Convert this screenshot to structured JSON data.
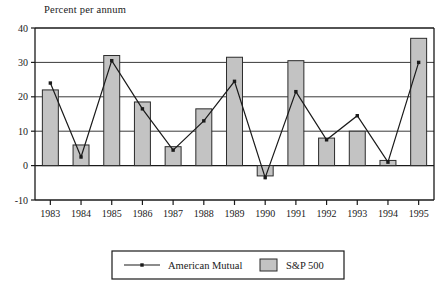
{
  "chart_data": {
    "type": "bar",
    "title": "Percent per annum",
    "xlabel": "",
    "ylabel": "",
    "ylim": [
      -10,
      40
    ],
    "yticks": [
      -10,
      0,
      10,
      20,
      30,
      40
    ],
    "ytick_labels": [
      "-10",
      "0",
      "10",
      "20",
      "30",
      "40"
    ],
    "grid": true,
    "grid_axis": "y",
    "legend_position": "bottom",
    "categories": [
      "1983",
      "1984",
      "1985",
      "1986",
      "1987",
      "1988",
      "1989",
      "1990",
      "1991",
      "1992",
      "1993",
      "1994",
      "1995"
    ],
    "series": [
      {
        "name": "S&P 500",
        "type": "bar",
        "color": "#c3c3c3",
        "edge_color": "#2b2b2b",
        "values": [
          22,
          6,
          32,
          18.5,
          5.5,
          16.5,
          31.5,
          -3,
          30.5,
          8,
          10,
          1.5,
          37
        ]
      },
      {
        "name": "American Mutual",
        "type": "line",
        "color": "#1a1a1a",
        "marker": "square",
        "values": [
          24,
          2.5,
          30.5,
          16.5,
          4.5,
          13,
          24.5,
          -3.5,
          21.5,
          7.5,
          14.5,
          1,
          30
        ]
      }
    ]
  },
  "legend": {
    "entries": [
      {
        "label": "American Mutual",
        "marker": "line-with-point"
      },
      {
        "label": "S&P 500",
        "marker": "filled-square"
      }
    ]
  },
  "axes": {
    "y_title": "Percent per annum"
  }
}
